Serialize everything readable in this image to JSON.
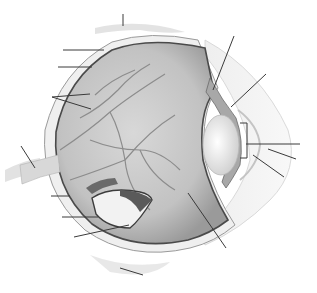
{
  "diagram": {
    "title": "",
    "style": "grayscale anatomical illustration",
    "colors": {
      "background": "#ffffff",
      "leader_line": "#3a3a3a",
      "sclera_edge": "#4a4a4a",
      "vitreous": "#bdbdbd",
      "vessel": "#8a8a8a",
      "lens": "#ececec",
      "tissue": "#e4e4e4"
    },
    "leader_lines": [
      {
        "id": "top-muscle",
        "x1": 123,
        "y1": 14,
        "x2": 123,
        "y2": 26,
        "label": ""
      },
      {
        "id": "sclera",
        "x1": 63,
        "y1": 50,
        "x2": 104,
        "y2": 50,
        "label": ""
      },
      {
        "id": "choroid",
        "x1": 58,
        "y1": 67,
        "x2": 92,
        "y2": 67,
        "label": ""
      },
      {
        "id": "retina-a",
        "x1": 52,
        "y1": 97,
        "x2": 90,
        "y2": 94,
        "label": ""
      },
      {
        "id": "retina-b",
        "x1": 52,
        "y1": 97,
        "x2": 91,
        "y2": 109,
        "label": ""
      },
      {
        "id": "ciliary-body",
        "x1": 234,
        "y1": 36,
        "x2": 213,
        "y2": 90,
        "label": ""
      },
      {
        "id": "iris",
        "x1": 266,
        "y1": 74,
        "x2": 231,
        "y2": 107,
        "label": ""
      },
      {
        "id": "cornea",
        "x1": 246,
        "y1": 144,
        "x2": 300,
        "y2": 144,
        "label": ""
      },
      {
        "id": "pupil",
        "x1": 268,
        "y1": 149,
        "x2": 296,
        "y2": 159,
        "label": ""
      },
      {
        "id": "anterior-chamber",
        "x1": 253,
        "y1": 155,
        "x2": 284,
        "y2": 177,
        "label": ""
      },
      {
        "id": "vitreous-body",
        "x1": 188,
        "y1": 193,
        "x2": 226,
        "y2": 248,
        "label": ""
      },
      {
        "id": "optic-nerve",
        "x1": 21,
        "y1": 146,
        "x2": 35,
        "y2": 168,
        "label": ""
      },
      {
        "id": "fovea",
        "x1": 51,
        "y1": 196,
        "x2": 70,
        "y2": 196,
        "label": ""
      },
      {
        "id": "optic-disc",
        "x1": 62,
        "y1": 217,
        "x2": 98,
        "y2": 217,
        "label": ""
      },
      {
        "id": "blood-vessels",
        "x1": 74,
        "y1": 237,
        "x2": 129,
        "y2": 225,
        "label": ""
      },
      {
        "id": "bottom-muscle",
        "x1": 120,
        "y1": 268,
        "x2": 143,
        "y2": 275,
        "label": ""
      }
    ],
    "bracket": {
      "x": 247,
      "y1": 123,
      "y2": 158,
      "tick_x": 240
    }
  }
}
